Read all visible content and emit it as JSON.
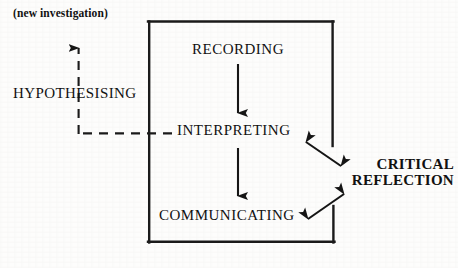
{
  "diagram": {
    "title": "",
    "type": "cycle-flow-diagram",
    "colors": {
      "ink": "#111111",
      "background": "#fdfdfc",
      "line": "#1a1a1a"
    },
    "nodes": {
      "new_investigation": "(new investigation)",
      "hypothesising": "HYPOTHESISING",
      "recording": "RECORDING",
      "interpreting": "INTERPRETING",
      "communicating": "COMMUNICATING",
      "critical_reflection_line1": "CRITICAL",
      "critical_reflection_line2": "REFLECTION"
    },
    "edges": [
      {
        "name": "recording-to-interpreting",
        "from": "RECORDING",
        "to": "INTERPRETING",
        "style": "solid",
        "arrow": "single"
      },
      {
        "name": "interpreting-to-communicating",
        "from": "INTERPRETING",
        "to": "COMMUNICATING",
        "style": "solid",
        "arrow": "single"
      },
      {
        "name": "interpreting-to-critical-reflection",
        "from": "INTERPRETING",
        "to": "CRITICAL REFLECTION",
        "style": "solid",
        "arrow": "double"
      },
      {
        "name": "communicating-to-critical-reflection",
        "from": "COMMUNICATING",
        "to": "CRITICAL REFLECTION",
        "style": "solid",
        "arrow": "double"
      },
      {
        "name": "interpreting-to-new-investigation",
        "from": "INTERPRETING",
        "to": "(new investigation)",
        "style": "dashed",
        "arrow": "single",
        "via": "HYPOTHESISING"
      },
      {
        "name": "enclosing-cycle-path",
        "from": "RECORDING",
        "to": "COMMUNICATING",
        "style": "solid",
        "arrow": "none"
      }
    ]
  }
}
